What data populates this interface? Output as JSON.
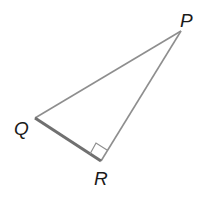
{
  "diagram": {
    "type": "right-triangle",
    "vertices": [
      {
        "label": "P",
        "x": 181,
        "y": 31
      },
      {
        "label": "Q",
        "x": 35,
        "y": 118
      },
      {
        "label": "R",
        "x": 101,
        "y": 161
      }
    ],
    "right_angle_at": "R",
    "highlighted_side": "QR",
    "colors": {
      "edge": "#8a8a8a",
      "highlight": "#6e6e6e",
      "label": "#1a1a1a"
    }
  }
}
